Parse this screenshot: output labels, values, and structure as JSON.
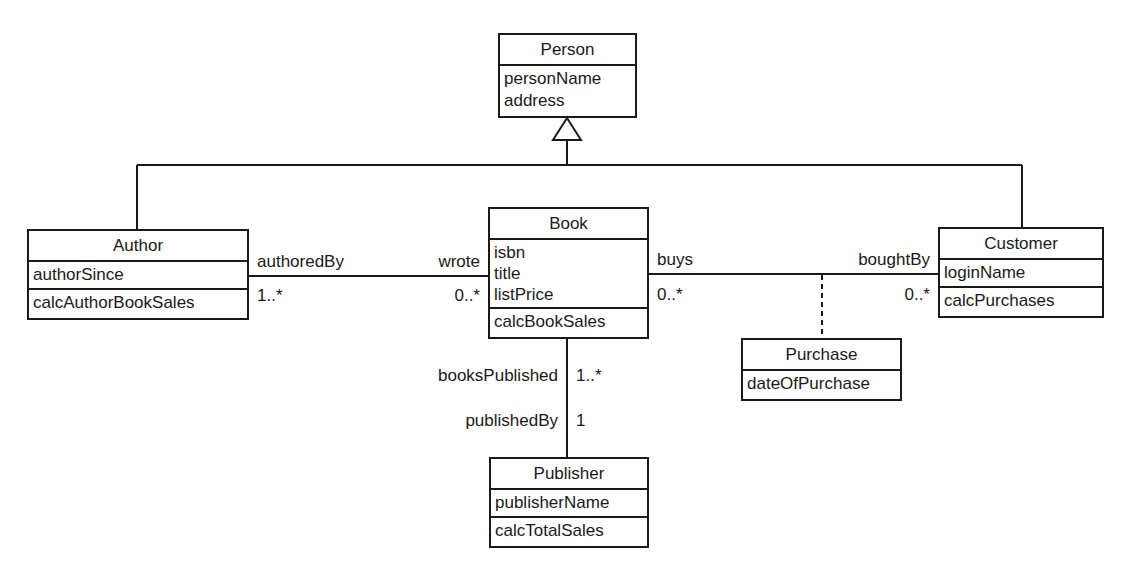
{
  "classes": {
    "person": {
      "name": "Person",
      "attributes": [
        "personName",
        "address"
      ]
    },
    "author": {
      "name": "Author",
      "attributes": [
        "authorSince"
      ],
      "operations": [
        "calcAuthorBookSales"
      ]
    },
    "book": {
      "name": "Book",
      "attributes": [
        "isbn",
        "title",
        "listPrice"
      ],
      "operations": [
        "calcBookSales"
      ]
    },
    "customer": {
      "name": "Customer",
      "attributes": [
        "loginName"
      ],
      "operations": [
        "calcPurchases"
      ]
    },
    "purchase": {
      "name": "Purchase",
      "attributes": [
        "dateOfPurchase"
      ]
    },
    "publisher": {
      "name": "Publisher",
      "attributes": [
        "publisherName"
      ],
      "operations": [
        "calcTotalSales"
      ]
    }
  },
  "associations": {
    "author_book": {
      "author_role": "authoredBy",
      "author_mult": "1..*",
      "book_role": "wrote",
      "book_mult": "0..*"
    },
    "book_customer": {
      "book_role": "buys",
      "book_mult": "0..*",
      "customer_role": "boughtBy",
      "customer_mult": "0..*"
    },
    "book_publisher": {
      "book_role": "booksPublished",
      "book_mult": "1..*",
      "publisher_role": "publishedBy",
      "publisher_mult": "1"
    }
  }
}
